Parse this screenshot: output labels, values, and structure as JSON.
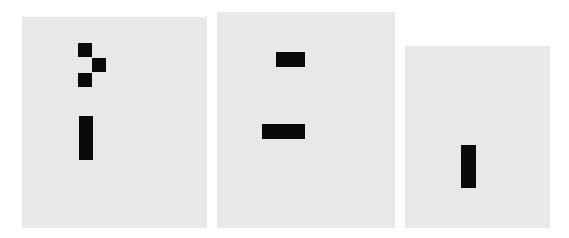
{
  "colors": {
    "background": "#ffffff",
    "panel": "#e8e8e8",
    "block": "#0a0a0a"
  },
  "panels": [
    {
      "id": "panel-1",
      "rect": {
        "x": 22,
        "y": 17,
        "w": 185,
        "h": 211
      },
      "blocks": [
        {
          "shape": "square",
          "x": 78,
          "y": 43,
          "w": 14,
          "h": 14
        },
        {
          "shape": "square",
          "x": 92,
          "y": 58,
          "w": 14,
          "h": 14
        },
        {
          "shape": "square",
          "x": 78,
          "y": 73,
          "w": 14,
          "h": 14
        },
        {
          "shape": "vertical-bar",
          "x": 79,
          "y": 116,
          "w": 14,
          "h": 44
        }
      ]
    },
    {
      "id": "panel-2",
      "rect": {
        "x": 217,
        "y": 12,
        "w": 178,
        "h": 216
      },
      "blocks": [
        {
          "shape": "horizontal-bar",
          "x": 276,
          "y": 52,
          "w": 29,
          "h": 15
        },
        {
          "shape": "horizontal-bar",
          "x": 262,
          "y": 124,
          "w": 43,
          "h": 15
        }
      ]
    },
    {
      "id": "panel-3",
      "rect": {
        "x": 405,
        "y": 46,
        "w": 145,
        "h": 182
      },
      "blocks": [
        {
          "shape": "vertical-bar",
          "x": 461,
          "y": 145,
          "w": 15,
          "h": 43
        }
      ]
    }
  ]
}
